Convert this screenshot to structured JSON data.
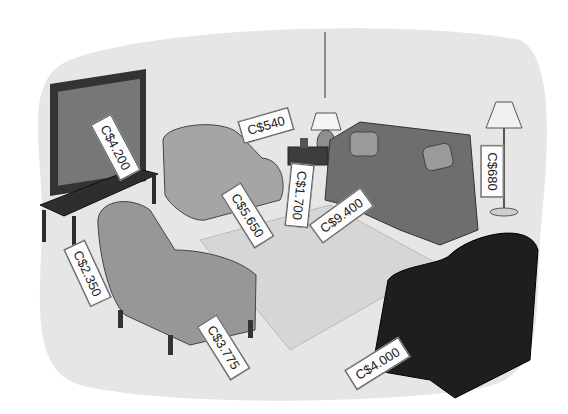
{
  "scene": {
    "description": "Living room illustration with furniture price tags in Canadian dollars",
    "colors": {
      "background_blob": "#e6e6e6",
      "rug": "#d9d9d9",
      "furniture_light": "#a8a8a8",
      "furniture_mid": "#8a8a8a",
      "furniture_dark": "#3a3a3a",
      "recliner": "#1e1e1e",
      "tag_bg": "#fdfdfd"
    }
  },
  "tags": [
    {
      "item": "television",
      "price": "C$4.200"
    },
    {
      "item": "table-lamp",
      "price": "C$540"
    },
    {
      "item": "floor-lamp",
      "price": "C$680"
    },
    {
      "item": "armchair-back",
      "price": "C$5.650"
    },
    {
      "item": "side-table",
      "price": "C$1.700"
    },
    {
      "item": "sofa",
      "price": "C$9.400"
    },
    {
      "item": "tv-stand",
      "price": "C$2.350"
    },
    {
      "item": "armchair-front",
      "price": "C$3.775"
    },
    {
      "item": "recliner",
      "price": "C$4.000"
    }
  ]
}
